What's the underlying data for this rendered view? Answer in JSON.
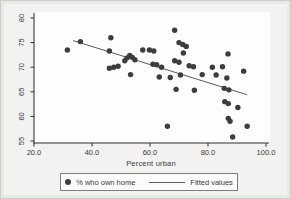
{
  "chart_data": {
    "type": "scatter",
    "title": "",
    "xlabel": "Percent urban",
    "ylabel": "",
    "xlim": [
      20,
      100
    ],
    "ylim": [
      55,
      80
    ],
    "grid": false,
    "legend_position": "bottom-center-boxed",
    "x_ticks": [
      "20.0",
      "40.0",
      "60.0",
      "80.0",
      "100.0"
    ],
    "x_tick_values": [
      20,
      40,
      60,
      80,
      100
    ],
    "y_ticks": [
      "55",
      "60",
      "65",
      "70",
      "75",
      "80"
    ],
    "y_tick_values": [
      55,
      60,
      65,
      70,
      75,
      80
    ],
    "legend": [
      {
        "label": "% who own home",
        "marker": "dot"
      },
      {
        "label": "Fitted values",
        "marker": "line"
      }
    ],
    "series": [
      {
        "name": "% who own home",
        "type": "scatter",
        "points": [
          [
            31.5,
            73.5
          ],
          [
            36,
            75.2
          ],
          [
            46.5,
            76.0
          ],
          [
            46,
            73.3
          ],
          [
            46,
            69.8
          ],
          [
            47.5,
            70.0
          ],
          [
            49,
            70.2
          ],
          [
            51.3,
            71.3
          ],
          [
            52.1,
            71.9
          ],
          [
            53,
            72.4
          ],
          [
            53.9,
            72.0
          ],
          [
            54.8,
            71.5
          ],
          [
            53.3,
            68.5
          ],
          [
            57.5,
            73.5
          ],
          [
            59.8,
            73.5
          ],
          [
            61.3,
            73.3
          ],
          [
            61,
            70.6
          ],
          [
            62.3,
            70.5
          ],
          [
            64,
            70.0
          ],
          [
            63.2,
            68.0
          ],
          [
            66,
            58.0
          ],
          [
            67,
            67.9
          ],
          [
            68.5,
            77.5
          ],
          [
            70,
            75.0
          ],
          [
            71.3,
            74.6
          ],
          [
            72.5,
            74.2
          ],
          [
            68.5,
            71.3
          ],
          [
            70,
            71.0
          ],
          [
            71.5,
            72.9
          ],
          [
            70.5,
            68.4
          ],
          [
            69,
            65.5
          ],
          [
            73.5,
            70.3
          ],
          [
            75,
            70.1
          ],
          [
            75.3,
            65.3
          ],
          [
            78,
            68.5
          ],
          [
            81.5,
            70.0
          ],
          [
            82.8,
            68.4
          ],
          [
            85,
            70.1
          ],
          [
            86.9,
            72.7
          ],
          [
            92.3,
            69.2
          ],
          [
            86.5,
            67.8
          ],
          [
            85.6,
            65.7
          ],
          [
            87.2,
            65.4
          ],
          [
            85.8,
            63.0
          ],
          [
            87,
            62.6
          ],
          [
            87,
            59.6
          ],
          [
            87.6,
            59.0
          ],
          [
            88.5,
            55.8
          ],
          [
            90.3,
            61.8
          ],
          [
            93.5,
            58.0
          ]
        ]
      },
      {
        "name": "Fitted values",
        "type": "line",
        "points": [
          [
            33.5,
            75.4
          ],
          [
            93.5,
            64.4
          ]
        ]
      }
    ],
    "colors": {
      "marker": "#3d3d3d",
      "fitted_line": "#5a5a5a",
      "axis": "#2a2a2a",
      "text": "#3a3a3a",
      "plot_bg": "#fdfdfd",
      "figure_bg": "#f2f3f0"
    }
  }
}
